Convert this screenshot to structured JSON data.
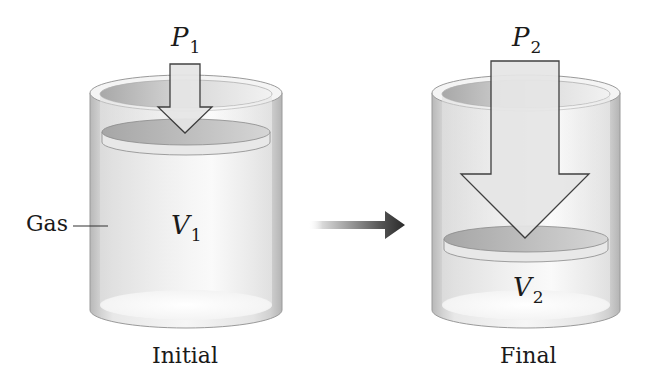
{
  "diagram": {
    "initial": {
      "caption": "Initial",
      "pressure_symbol": "P",
      "pressure_subscript": "1",
      "volume_symbol": "V",
      "volume_subscript": "1",
      "gas_label": "Gas"
    },
    "final": {
      "caption": "Final",
      "pressure_symbol": "P",
      "pressure_subscript": "2",
      "volume_symbol": "V",
      "volume_subscript": "2"
    },
    "transition_arrow": "right-arrow",
    "colors": {
      "background": "#ffffff",
      "cylinder_wall": "#c8c8c8",
      "cylinder_inner": "#ececec",
      "piston_top": "#b4b4b4",
      "piston_edge": "#e6e6e6",
      "arrow_fill": "#e2e2e2",
      "arrow_stroke": "#3a3a3a",
      "transition_arrow_dark": "#2a2a2a",
      "transition_arrow_light": "#d8d8d8"
    }
  }
}
